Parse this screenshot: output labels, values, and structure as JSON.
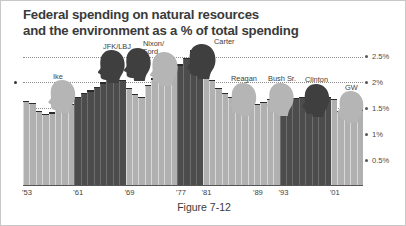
{
  "figure": {
    "title": "Federal spending on natural resources and the environment as a % of total spending",
    "title_line1": "Federal spending on natural resources",
    "title_line2": "and the environment as a % of total spending",
    "caption": "Figure 7-12"
  },
  "colors": {
    "republican_bar": "#b0b0b0",
    "democrat_bar": "#4c4c4c",
    "gridline": "#8e8e8e",
    "text": "#3a3a3a",
    "background": "#ffffff"
  },
  "presidents": [
    {
      "name": "Ike",
      "label": "Ike",
      "party": "rep",
      "label_x": 30,
      "label_y": 32,
      "head_x": 24,
      "head_y": 38,
      "head_w": 30,
      "head_h": 34,
      "tone": "light",
      "flip": false
    },
    {
      "name": "JFK/LBJ",
      "label": "JFK/LBJ",
      "party": "dem",
      "label_x": 80,
      "label_y": 2,
      "head_x": 74,
      "head_y": 8,
      "head_w": 29,
      "head_h": 34,
      "tone": "dark",
      "flip": false
    },
    {
      "name": "JFK/LBJ-2",
      "label": "",
      "party": "dem",
      "label_x": 0,
      "label_y": 0,
      "head_x": 100,
      "head_y": 6,
      "head_w": 29,
      "head_h": 34,
      "tone": "dark",
      "flip": false
    },
    {
      "name": "Nixon/Ford",
      "label": "Nixon/",
      "label2": "Ford",
      "party": "rep",
      "label_x": 120,
      "label_y": -1,
      "head_x": 126,
      "head_y": 10,
      "head_w": 30,
      "head_h": 35,
      "tone": "light",
      "flip": false
    },
    {
      "name": "Carter",
      "label": "Carter",
      "party": "dem",
      "label_x": 191,
      "label_y": -3,
      "head_x": 163,
      "head_y": 2,
      "head_w": 31,
      "head_h": 36,
      "tone": "dark",
      "flip": false
    },
    {
      "name": "Reagan",
      "label": "Reagan",
      "party": "rep",
      "label_x": 208,
      "label_y": 34,
      "head_x": 205,
      "head_y": 41,
      "head_w": 30,
      "head_h": 34,
      "tone": "light",
      "flip": false
    },
    {
      "name": "Bush Sr.",
      "label": "Bush Sr.",
      "party": "rep",
      "label_x": 245,
      "label_y": 34,
      "head_x": 243,
      "head_y": 41,
      "head_w": 29,
      "head_h": 34,
      "tone": "light",
      "flip": false
    },
    {
      "name": "Clinton",
      "label": "Clinton",
      "party": "dem",
      "label_x": 282,
      "label_y": 35,
      "head_x": 278,
      "head_y": 42,
      "head_w": 30,
      "head_h": 34,
      "tone": "dark",
      "flip": false
    },
    {
      "name": "GW",
      "label": "GW",
      "party": "rep",
      "label_x": 322,
      "label_y": 43,
      "head_x": 313,
      "head_y": 49,
      "head_w": 29,
      "head_h": 33,
      "tone": "light",
      "flip": false
    }
  ],
  "chart_data": {
    "type": "bar",
    "title": "Federal spending on natural resources and the environment as a % of total spending",
    "xlabel": "",
    "ylabel": "% of total spending",
    "ylim": [
      0,
      2.8
    ],
    "xlim": [
      "1953",
      "2005"
    ],
    "grid": true,
    "legend": "none",
    "ytick_labels": [
      "0.5%",
      "1%",
      "1.5%",
      "2%",
      "2.5%"
    ],
    "ytick_values": [
      0.5,
      1.0,
      1.5,
      2.0,
      2.5
    ],
    "xtick_labels": [
      "'53",
      "'61",
      "'69",
      "'77",
      "'81",
      "'89",
      "'93",
      "'01"
    ],
    "xtick_years": [
      1953,
      1961,
      1969,
      1977,
      1981,
      1989,
      1993,
      2001
    ],
    "bar_color_legend": {
      "dark": "Democratic president",
      "light": "Republican president"
    },
    "categories": [
      "1953",
      "1954",
      "1955",
      "1956",
      "1957",
      "1958",
      "1959",
      "1960",
      "1961",
      "1962",
      "1963",
      "1964",
      "1965",
      "1966",
      "1967",
      "1968",
      "1969",
      "1970",
      "1971",
      "1972",
      "1973",
      "1974",
      "1975",
      "1976",
      "1977",
      "1978",
      "1979",
      "1980",
      "1981",
      "1982",
      "1983",
      "1984",
      "1985",
      "1986",
      "1987",
      "1988",
      "1989",
      "1990",
      "1991",
      "1992",
      "1993",
      "1994",
      "1995",
      "1996",
      "1997",
      "1998",
      "1999",
      "2000",
      "2001",
      "2002",
      "2003",
      "2004",
      "2005"
    ],
    "values": [
      1.65,
      1.6,
      1.45,
      1.4,
      1.42,
      1.55,
      1.62,
      1.58,
      1.72,
      1.8,
      1.85,
      1.92,
      2.0,
      2.1,
      2.2,
      2.05,
      1.9,
      1.78,
      1.72,
      1.95,
      2.08,
      2.18,
      2.22,
      2.3,
      2.35,
      2.48,
      2.62,
      2.45,
      2.3,
      2.05,
      1.9,
      1.8,
      1.72,
      1.65,
      1.62,
      1.6,
      1.58,
      1.62,
      1.68,
      1.72,
      1.68,
      1.72,
      1.7,
      1.72,
      1.7,
      1.72,
      1.7,
      1.72,
      1.68,
      1.45,
      1.42,
      1.5,
      1.48
    ],
    "party_by_year": [
      "rep",
      "rep",
      "rep",
      "rep",
      "rep",
      "rep",
      "rep",
      "rep",
      "dem",
      "dem",
      "dem",
      "dem",
      "dem",
      "dem",
      "dem",
      "dem",
      "rep",
      "rep",
      "rep",
      "rep",
      "rep",
      "rep",
      "rep",
      "rep",
      "dem",
      "dem",
      "dem",
      "dem",
      "rep",
      "rep",
      "rep",
      "rep",
      "rep",
      "rep",
      "rep",
      "rep",
      "rep",
      "rep",
      "rep",
      "rep",
      "dem",
      "dem",
      "dem",
      "dem",
      "dem",
      "dem",
      "dem",
      "dem",
      "rep",
      "rep",
      "rep",
      "rep",
      "rep"
    ]
  }
}
